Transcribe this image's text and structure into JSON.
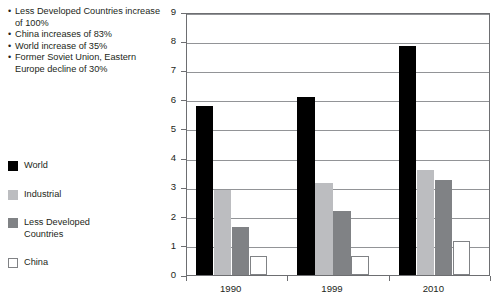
{
  "annotations": {
    "bullet_char": "•",
    "items": [
      "Less Developed Countries increase of 100%",
      "China increases of 83%",
      "World increase of 35%",
      "Former Soviet Union, Eastern Europe decline of 30%"
    ]
  },
  "legend": {
    "items": [
      {
        "label": "World",
        "color": "#000000"
      },
      {
        "label": "Industrial",
        "color": "#bcbdc0"
      },
      {
        "label": "Less Developed Countries",
        "color": "#808285"
      },
      {
        "label": "China",
        "color": "#ffffff"
      }
    ]
  },
  "axes": {
    "y_ticks": [
      "0",
      "1",
      "2",
      "3",
      "4",
      "5",
      "6",
      "7",
      "8",
      "9"
    ],
    "x_ticks": [
      "1990",
      "1999",
      "2010"
    ]
  },
  "chart_data": {
    "type": "bar",
    "title": "",
    "xlabel": "",
    "ylabel": "",
    "ylim": [
      0,
      9
    ],
    "grid": true,
    "legend_position": "left",
    "categories": [
      "1990",
      "1999",
      "2010"
    ],
    "series": [
      {
        "name": "World",
        "color": "#000000",
        "values": [
          5.8,
          6.1,
          7.85
        ]
      },
      {
        "name": "Industrial",
        "color": "#bcbdc0",
        "values": [
          2.9,
          3.15,
          3.6
        ]
      },
      {
        "name": "Less Developed Countries",
        "color": "#808285",
        "values": [
          1.65,
          2.2,
          3.25
        ]
      },
      {
        "name": "China",
        "color": "#ffffff",
        "values": [
          0.65,
          0.65,
          1.15
        ]
      }
    ],
    "annotations": [
      "Less Developed Countries increase of 100%",
      "China increases of 83%",
      "World increase of 35%",
      "Former Soviet Union, Eastern Europe decline of 30%"
    ]
  }
}
